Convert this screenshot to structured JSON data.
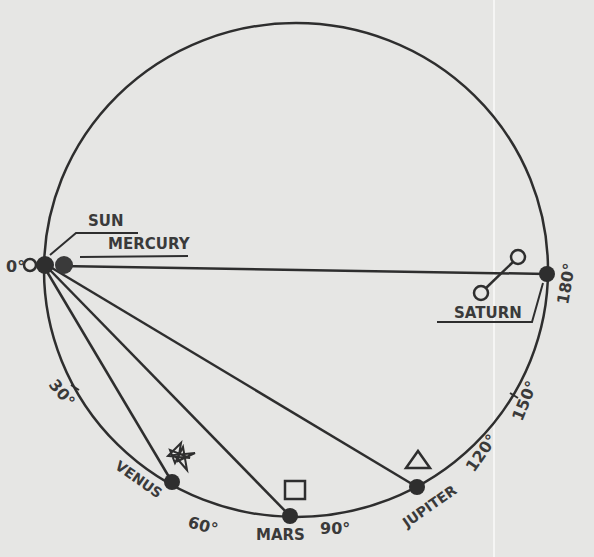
{
  "diagram": {
    "type": "planetary-alignment-orbit-diagram",
    "colors": {
      "background": "#e6e6e4",
      "ink": "#2e2e2e",
      "label": "#3a3a3a"
    },
    "degree_labels": {
      "d0": "0°",
      "d30": "30°",
      "d60": "60°",
      "d90": "90°",
      "d120": "120°",
      "d150": "150°",
      "d180": "180°"
    },
    "bodies": {
      "sun": {
        "label": "SUN",
        "symbol": "sun-symbol"
      },
      "mercury": {
        "label": "MERCURY",
        "symbol": "mercury-symbol"
      },
      "venus": {
        "label": "VENUS",
        "symbol": "star"
      },
      "mars": {
        "label": "MARS",
        "symbol": "square"
      },
      "jupiter": {
        "label": "JUPITER",
        "symbol": "triangle"
      },
      "saturn": {
        "label": "SATURN",
        "symbol": "opposition-symbol"
      }
    }
  }
}
